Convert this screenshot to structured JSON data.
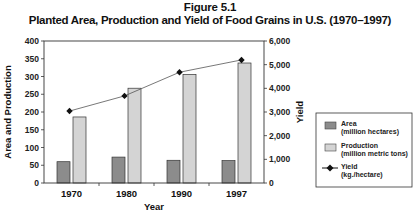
{
  "figure": {
    "label": "Figure 5.1",
    "title": "Planted Area, Production and Yield of Food Grains in U.S. (1970–1997)"
  },
  "axes": {
    "x_label": "Year",
    "y_left_label": "Area and Production",
    "y_right_label": "Yield",
    "y_left_ticks": [
      "0",
      "50",
      "100",
      "150",
      "200",
      "250",
      "300",
      "350",
      "400"
    ],
    "y_right_ticks": [
      "0",
      "1,000",
      "2,000",
      "3,000",
      "4,000",
      "5,000",
      "6,000"
    ]
  },
  "legend": {
    "items": [
      {
        "line1": "Area",
        "line2": "(million hectares)",
        "color": "#8c8c8c"
      },
      {
        "line1": "Production",
        "line2": "(million metric tons)",
        "color": "#d4d4d4"
      },
      {
        "line1": "Yield",
        "line2": "(kg./hectare)",
        "color": "#111111"
      }
    ]
  },
  "chart_data": {
    "type": "bar",
    "title": "Planted Area, Production and Yield of Food Grains in U.S. (1970–1997)",
    "subtitle": "Figure 5.1",
    "categories": [
      "1970",
      "1980",
      "1990",
      "1997"
    ],
    "xlabel": "Year",
    "ylabel": "Area and Production",
    "ylim": [
      0,
      400
    ],
    "y2label": "Yield",
    "y2lim": [
      0,
      6000
    ],
    "series": [
      {
        "name": "Area (million hectares)",
        "type": "bar",
        "axis": "left",
        "color": "#8c8c8c",
        "values": [
          60,
          73,
          64,
          63
        ]
      },
      {
        "name": "Production (million metric tons)",
        "type": "bar",
        "axis": "left",
        "color": "#d4d4d4",
        "values": [
          186,
          267,
          306,
          338
        ]
      },
      {
        "name": "Yield (kg./hectare)",
        "type": "line",
        "axis": "right",
        "color": "#111111",
        "values": [
          3040,
          3680,
          4680,
          5200
        ]
      }
    ],
    "grid": false,
    "legend_position": "right"
  }
}
